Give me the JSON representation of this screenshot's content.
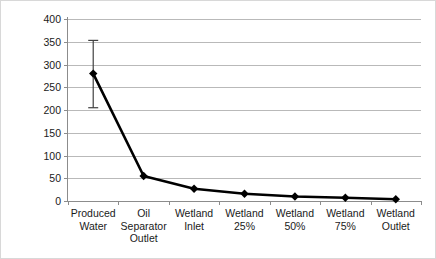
{
  "chart_data": {
    "type": "line",
    "title": "",
    "xlabel": "",
    "ylabel": "Oil in Water (mg/L)",
    "categories": [
      "Produced\nWater",
      "Oil\nSeparator\nOutlet",
      "Wetland\nInlet",
      "Wetland\n25%",
      "Wetland\n50%",
      "Wetland\n75%",
      "Wetland\nOutlet"
    ],
    "category_lines": [
      [
        "Produced",
        "Water"
      ],
      [
        "Oil",
        "Separator",
        "Outlet"
      ],
      [
        "Wetland",
        "Inlet"
      ],
      [
        "Wetland",
        "25%"
      ],
      [
        "Wetland",
        "50%"
      ],
      [
        "Wetland",
        "75%"
      ],
      [
        "Wetland",
        "Outlet"
      ]
    ],
    "values": [
      280,
      55,
      27,
      16,
      10,
      7,
      4
    ],
    "error_bars": [
      {
        "index": 0,
        "low": 205,
        "high": 353
      }
    ],
    "ylim": [
      0,
      400
    ],
    "yticks": [
      0,
      50,
      100,
      150,
      200,
      250,
      300,
      350,
      400
    ],
    "ytick_labels": [
      "0",
      "50",
      "100",
      "150",
      "200",
      "250",
      "300",
      "350",
      "400"
    ],
    "grid": true,
    "legend": false,
    "marker": "diamond",
    "line_color": "#000000",
    "grid_color": "#b9b9b9",
    "axis_color": "#8c8c8c",
    "background": "#ffffff"
  }
}
